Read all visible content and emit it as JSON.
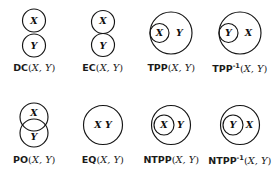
{
  "figure": {
    "region_x": "X",
    "region_y": "Y",
    "stroke_color": "#141414",
    "background_color": "#ffffff",
    "columns": 4,
    "rows": 2
  },
  "relations": [
    {
      "id": "dc",
      "name": "DC",
      "superscript": "",
      "args": "(X, Y)",
      "caption": "DC(X,Y)",
      "meaning": "disconnected",
      "labels": [
        "X",
        "Y"
      ],
      "shape": "two separate circles, X above Y, not touching"
    },
    {
      "id": "ec",
      "name": "EC",
      "superscript": "",
      "args": "(X, Y)",
      "caption": "EC(X,Y)",
      "meaning": "externally connected",
      "labels": [
        "X",
        "Y"
      ],
      "shape": "two circles, X above Y, externally tangent"
    },
    {
      "id": "tpp",
      "name": "TPP",
      "superscript": "",
      "args": "(X, Y)",
      "caption": "TPP(X,Y)",
      "meaning": "tangential proper part",
      "labels": [
        "X",
        "Y"
      ],
      "shape": "small circle X internally tangent inside large circle Y"
    },
    {
      "id": "tpp-inverse",
      "name": "TPP",
      "superscript": "-1",
      "args": "(X, Y)",
      "caption": "TPP⁻¹(X,Y)",
      "meaning": "tangential proper part inverse",
      "labels": [
        "Y",
        "X"
      ],
      "shape": "small circle Y internally tangent inside large circle X"
    },
    {
      "id": "po",
      "name": "PO",
      "superscript": "",
      "args": "(X, Y)",
      "caption": "PO(X,Y)",
      "meaning": "partially overlapping",
      "labels": [
        "X",
        "Y"
      ],
      "shape": "two circles of equal size overlapping, X above Y"
    },
    {
      "id": "eq",
      "name": "EQ",
      "superscript": "",
      "args": "(X, Y)",
      "caption": "EQ(X,Y)",
      "meaning": "equal",
      "labels": [
        "X Y"
      ],
      "shape": "one circle containing both labels X Y"
    },
    {
      "id": "ntpp",
      "name": "NTPP",
      "superscript": "",
      "args": "(X, Y)",
      "caption": "NTPP(X,Y)",
      "meaning": "non-tangential proper part",
      "labels": [
        "X",
        "Y"
      ],
      "shape": "small circle X strictly inside large circle Y, offset left"
    },
    {
      "id": "ntpp-inverse",
      "name": "NTPP",
      "superscript": "-1",
      "args": "(X, Y)",
      "caption": "NTPP⁻¹(X,Y)",
      "meaning": "non-tangential proper part inverse",
      "labels": [
        "Y",
        "X"
      ],
      "shape": "small circle Y strictly inside large circle X, offset left"
    }
  ],
  "captions": {
    "dc": {
      "rel": "DC",
      "sup": "",
      "open": "(",
      "args": "X, Y",
      "close": ")"
    },
    "ec": {
      "rel": "EC",
      "sup": "",
      "open": "(",
      "args": "X, Y",
      "close": ")"
    },
    "tpp": {
      "rel": "TPP",
      "sup": "",
      "open": "(",
      "args": "X, Y",
      "close": ")"
    },
    "tppi": {
      "rel": "TPP",
      "sup": "-1",
      "open": "(",
      "args": "X, Y",
      "close": ")"
    },
    "po": {
      "rel": "PO",
      "sup": "",
      "open": "(",
      "args": "X, Y",
      "close": ")"
    },
    "eq": {
      "rel": "EQ",
      "sup": "",
      "open": "(",
      "args": "X, Y",
      "close": ")"
    },
    "ntpp": {
      "rel": "NTPP",
      "sup": "",
      "open": "(",
      "args": "X, Y",
      "close": ")"
    },
    "ntppi": {
      "rel": "NTPP",
      "sup": "-1",
      "open": "(",
      "args": "X, Y",
      "close": ")"
    }
  },
  "glyphs": {
    "x": "X",
    "y": "Y",
    "xy": "X Y"
  }
}
